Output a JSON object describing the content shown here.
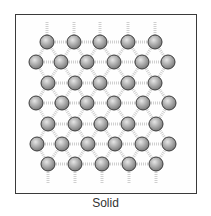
{
  "diagram": {
    "caption": "Solid",
    "colors": {
      "frame": "#3a3a3a",
      "atom_fill_light": "#e6e6e6",
      "atom_fill_dark": "#7a7a7a",
      "atom_outline": "#3c3c3c",
      "bond": "#cfcfcf"
    },
    "atom_radius": 7,
    "rows": [
      {
        "y": 42,
        "x": [
          47,
          74,
          100,
          128,
          155
        ]
      },
      {
        "y": 62,
        "x": [
          36,
          61,
          87,
          114,
          142,
          168
        ]
      },
      {
        "y": 83,
        "x": [
          48,
          75,
          100,
          128,
          155
        ]
      },
      {
        "y": 103,
        "x": [
          36,
          62,
          87,
          114,
          143,
          169
        ]
      },
      {
        "y": 124,
        "x": [
          48,
          75,
          101,
          128,
          156
        ]
      },
      {
        "y": 144,
        "x": [
          37,
          62,
          88,
          115,
          142,
          169
        ]
      },
      {
        "y": 164,
        "x": [
          48,
          75,
          102,
          129,
          156
        ]
      }
    ]
  }
}
